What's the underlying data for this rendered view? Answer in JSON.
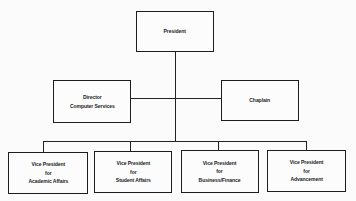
{
  "chart": {
    "title": "",
    "nodes": {
      "president": {
        "label": "President"
      },
      "director": {
        "label": "Director\nComputer Services"
      },
      "chaplain": {
        "label": "Chaplain"
      },
      "vp_academic": {
        "label": "Vice President\nfor\nAcademic Affairs"
      },
      "vp_student": {
        "label": "Vice President\nfor\nStudent Affairs"
      },
      "vp_business": {
        "label": "Vice President\nfor\nBusiness/Finance"
      },
      "vp_advancement": {
        "label": "Vice President\nfor\nAdvancement"
      }
    },
    "edges": [
      [
        "President",
        "Director Computer Services"
      ],
      [
        "President",
        "Chaplain"
      ],
      [
        "President",
        "Vice President for Academic Affairs"
      ],
      [
        "President",
        "Vice President for Student Affairs"
      ],
      [
        "President",
        "Vice President for Business/Finance"
      ],
      [
        "President",
        "Vice President for Advancement"
      ]
    ],
    "colors": {
      "line": "#222222",
      "background": "#fbfbfb"
    }
  }
}
